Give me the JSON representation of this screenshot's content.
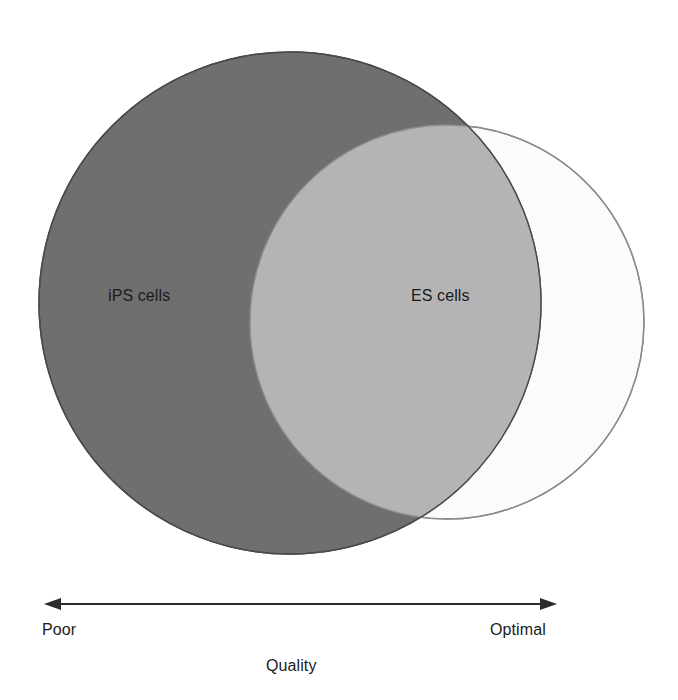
{
  "figure": {
    "type": "venn-diagram",
    "background_color": "#ffffff",
    "sets": [
      {
        "id": "ips",
        "label": "iPS cells",
        "fill_color": "#6f6f6f",
        "stroke_color": "#4a4a4a",
        "center_x": 290,
        "center_y": 303,
        "radius": 251
      },
      {
        "id": "es",
        "label": "ES cells",
        "fill_color": "#fbfbfb",
        "stroke_color": "#8c8c8c",
        "center_x": 447,
        "center_y": 322,
        "radius": 197
      }
    ],
    "overlap": {
      "label": "",
      "fill_color": "#b4b4b4"
    }
  },
  "axis": {
    "title": "Quality",
    "left_label": "Poor",
    "right_label": "Optimal",
    "arrow": {
      "x_start": 45,
      "x_end": 556,
      "y": 604,
      "color": "#2b2b2b",
      "double_headed": true
    }
  },
  "chart_data": {
    "type": "venn",
    "title": "",
    "xlabel": "Quality",
    "ylabel": "",
    "categories": [
      "iPS cells",
      "ES cells"
    ],
    "annotations": [
      "Poor",
      "Optimal"
    ],
    "series": [
      {
        "name": "iPS cells",
        "quality_range": "Poor to near-Optimal",
        "center_x": 290,
        "radius": 251,
        "color": "#6f6f6f"
      },
      {
        "name": "ES cells",
        "quality_range": "Mid to Optimal",
        "center_x": 447,
        "radius": 197,
        "color": "#fbfbfb"
      }
    ],
    "legend_position": "inside-shapes",
    "grid": false,
    "axis_ranges": {
      "x": [
        "Poor",
        "Optimal"
      ]
    }
  }
}
